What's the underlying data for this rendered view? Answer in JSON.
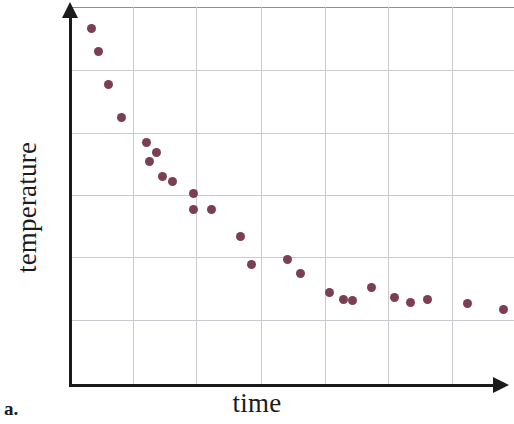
{
  "figure": {
    "caption": "a.",
    "xlabel": "time",
    "ylabel": "temperature"
  },
  "chart_data": {
    "type": "scatter",
    "title": "",
    "xlabel": "time",
    "ylabel": "temperature",
    "caption": "a.",
    "grid": true,
    "legend": null,
    "xlim": [
      0,
      7
    ],
    "ylim": [
      0,
      6
    ],
    "x_tick_labels": [],
    "y_tick_labels": [],
    "x_gridlines": [
      1,
      2,
      3,
      4,
      5,
      6
    ],
    "y_gridlines": [
      1,
      2,
      3,
      4,
      5,
      6
    ],
    "marker_color": "#7a3f52",
    "marker_size_px": 9,
    "grid_color": "#c9c9cf",
    "axis_color": "#1b1b1b",
    "points_px": [
      {
        "x": 91,
        "y": 28
      },
      {
        "x": 98,
        "y": 51
      },
      {
        "x": 108,
        "y": 84
      },
      {
        "x": 121,
        "y": 117
      },
      {
        "x": 146,
        "y": 142
      },
      {
        "x": 156,
        "y": 152
      },
      {
        "x": 149,
        "y": 161
      },
      {
        "x": 162,
        "y": 176
      },
      {
        "x": 172,
        "y": 181
      },
      {
        "x": 193,
        "y": 193
      },
      {
        "x": 193,
        "y": 209
      },
      {
        "x": 211,
        "y": 209
      },
      {
        "x": 240,
        "y": 236
      },
      {
        "x": 251,
        "y": 264
      },
      {
        "x": 287,
        "y": 259
      },
      {
        "x": 300,
        "y": 273
      },
      {
        "x": 329,
        "y": 292
      },
      {
        "x": 343,
        "y": 299
      },
      {
        "x": 352,
        "y": 300
      },
      {
        "x": 371,
        "y": 287
      },
      {
        "x": 394,
        "y": 297
      },
      {
        "x": 410,
        "y": 302
      },
      {
        "x": 427,
        "y": 299
      },
      {
        "x": 467,
        "y": 303
      },
      {
        "x": 503,
        "y": 309
      }
    ],
    "x": [
      0.33,
      0.44,
      0.59,
      0.8,
      1.19,
      1.35,
      1.24,
      1.44,
      1.6,
      1.92,
      1.92,
      2.2,
      2.66,
      2.83,
      3.39,
      3.59,
      4.05,
      4.27,
      4.41,
      4.7,
      5.06,
      5.31,
      5.58,
      6.2,
      6.77
    ],
    "y": [
      5.7,
      5.34,
      4.81,
      4.28,
      3.89,
      3.73,
      3.59,
      3.35,
      3.27,
      3.08,
      2.83,
      2.83,
      2.4,
      1.96,
      2.04,
      1.82,
      1.52,
      1.41,
      1.4,
      1.6,
      1.44,
      1.37,
      1.41,
      1.35,
      1.26
    ]
  }
}
